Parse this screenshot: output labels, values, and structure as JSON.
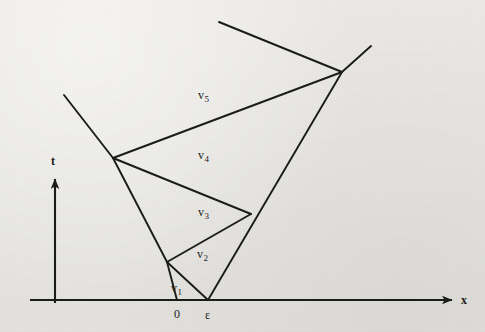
{
  "figure": {
    "kind": "spacetime-diagram",
    "caption": "",
    "background_color": "#e9e8e5",
    "ink_color": "#1a1a1a"
  },
  "axes": {
    "x_axis": {
      "label": "x",
      "arrow": true,
      "y": 300,
      "x_start": 30,
      "x_end": 455
    },
    "t_axis": {
      "label": "t",
      "arrow": true,
      "x": 55,
      "y_start": 300,
      "y_end": 175
    }
  },
  "ticks": [
    {
      "label": "0",
      "x": 177
    },
    {
      "label": "ε",
      "x": 208
    }
  ],
  "regions": [
    {
      "name": "v",
      "index": "1",
      "x": 175,
      "y": 288
    },
    {
      "name": "v",
      "index": "2",
      "x": 201,
      "y": 254
    },
    {
      "name": "v",
      "index": "3",
      "x": 202,
      "y": 212
    },
    {
      "name": "v",
      "index": "4",
      "x": 202,
      "y": 155
    },
    {
      "name": "v",
      "index": "5",
      "x": 202,
      "y": 95
    }
  ],
  "vertices": {
    "origin_0": {
      "x": 177,
      "y": 300
    },
    "origin_eps": {
      "x": 208,
      "y": 300
    },
    "node_a": {
      "x": 167,
      "y": 262
    },
    "node_b": {
      "x": 251,
      "y": 214
    },
    "node_c": {
      "x": 113,
      "y": 158
    },
    "node_d": {
      "x": 342,
      "y": 72
    },
    "tip_upper_left": {
      "x": 219,
      "y": 22
    },
    "tip_upper_right": {
      "x": 371,
      "y": 46
    },
    "tip_left": {
      "x": 64,
      "y": 95
    }
  },
  "segments": [
    {
      "id": "seg-0-to-a",
      "x1": 177,
      "y1": 300,
      "x2": 167,
      "y2": 262
    },
    {
      "id": "seg-a-to-eps",
      "x1": 167,
      "y1": 262,
      "x2": 208,
      "y2": 300
    },
    {
      "id": "seg-a-to-b",
      "x1": 167,
      "y1": 262,
      "x2": 251,
      "y2": 214
    },
    {
      "id": "seg-a-to-c",
      "x1": 167,
      "y1": 262,
      "x2": 113,
      "y2": 158
    },
    {
      "id": "seg-eps-to-d",
      "x1": 208,
      "y1": 300,
      "x2": 342,
      "y2": 72
    },
    {
      "id": "seg-b-to-c",
      "x1": 251,
      "y1": 214,
      "x2": 113,
      "y2": 158
    },
    {
      "id": "seg-c-to-d",
      "x1": 113,
      "y1": 158,
      "x2": 342,
      "y2": 72
    },
    {
      "id": "seg-c-to-tipleft",
      "x1": 113,
      "y1": 158,
      "x2": 64,
      "y2": 95
    },
    {
      "id": "seg-d-to-tipul",
      "x1": 342,
      "y1": 72,
      "x2": 219,
      "y2": 22
    },
    {
      "id": "seg-d-to-tipur",
      "x1": 342,
      "y1": 72,
      "x2": 371,
      "y2": 46
    }
  ]
}
